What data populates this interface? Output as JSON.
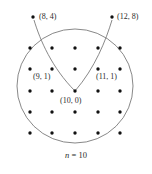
{
  "figure": {
    "caption": "n = 10",
    "caption_variable": "n",
    "caption_relation": " = 10",
    "background_color": "#ffffff",
    "stroke_color": "#7a7a7a",
    "dot_color": "#111111",
    "text_color": "#2b2b2b"
  },
  "circle": {
    "name": "boundary-circle",
    "center_x": 75,
    "center_y": 86,
    "radius_x": 58,
    "radius_y": 57
  },
  "lattice_grid": {
    "rows": 5,
    "columns": 5,
    "x_positions": [
      30,
      52,
      75,
      98,
      120
    ],
    "y_positions": [
      48,
      69,
      91,
      112,
      133
    ]
  },
  "outer_points": [
    {
      "name": "point-8-4",
      "label": "(8, 4)",
      "dot_x": 33,
      "dot_y": 17,
      "label_x": 39,
      "label_y": 12
    },
    {
      "name": "point-12-8",
      "label": "(12, 8)",
      "dot_x": 112,
      "dot_y": 17,
      "label_x": 117,
      "label_y": 12
    }
  ],
  "inner_labels": [
    {
      "name": "label-9-1",
      "label": "(9, 1)",
      "x": 33,
      "y": 72
    },
    {
      "name": "label-11-1",
      "label": "(11, 1)",
      "x": 96,
      "y": 72
    },
    {
      "name": "label-10-0",
      "label": "(10, 0)",
      "x": 60,
      "y": 96
    }
  ],
  "curves": [
    {
      "name": "left-parabola-branch",
      "path": "M 34 20 C 40 40, 52 68, 75 91"
    },
    {
      "name": "right-parabola-branch",
      "path": "M 112 20 C 106 40, 95 68, 75 91"
    }
  ],
  "chart_data": {
    "type": "scatter",
    "title": "",
    "subtitle": "",
    "xlabel": "",
    "ylabel": "",
    "annotations": [
      "(8, 4)",
      "(12, 8)",
      "(9, 1)",
      "(11, 1)",
      "(10, 0)",
      "n = 10"
    ],
    "legend": [],
    "grid": false,
    "description_points": [
      {
        "label": "(8, 4)",
        "x": 8,
        "y": 4
      },
      {
        "label": "(12, 8)",
        "x": 12,
        "y": 8
      },
      {
        "label": "(9, 1)",
        "x": 9,
        "y": 1
      },
      {
        "label": "(11, 1)",
        "x": 11,
        "y": 1
      },
      {
        "label": "(10, 0)",
        "x": 10,
        "y": 0
      }
    ],
    "lattice_points_visible": 25,
    "n": 10
  }
}
